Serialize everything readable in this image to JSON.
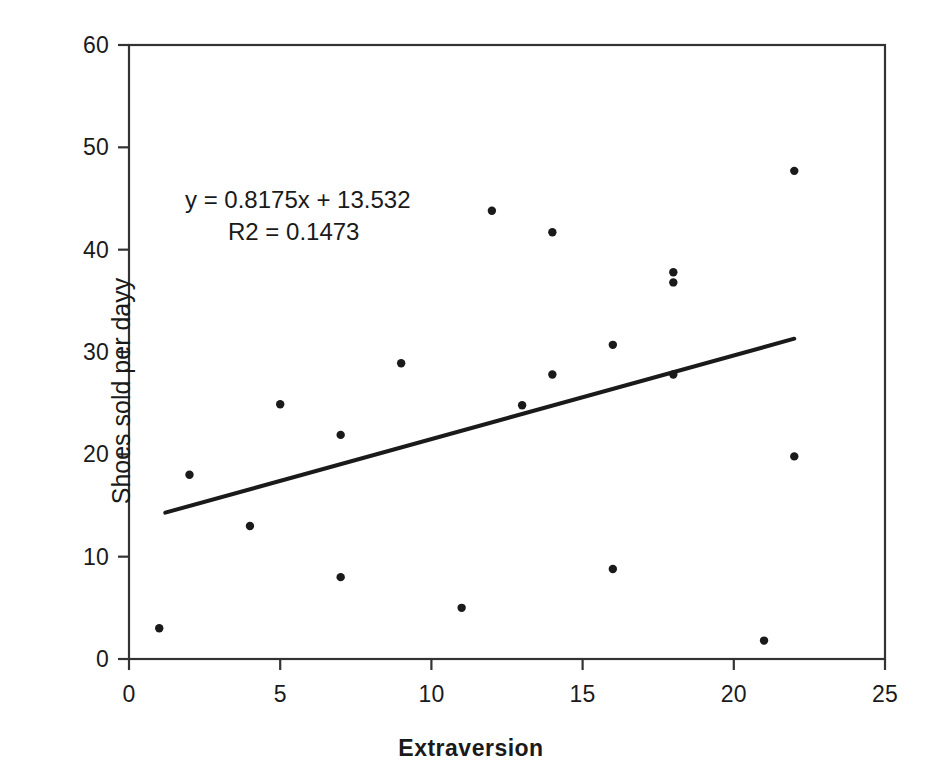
{
  "chart_data": {
    "type": "scatter",
    "title": "",
    "xlabel": "Extraversion",
    "ylabel": "Shoes sold per dayy",
    "xlim": [
      0,
      25
    ],
    "ylim": [
      0,
      60
    ],
    "xticks": [
      0,
      5,
      10,
      15,
      20,
      25
    ],
    "yticks": [
      0,
      10,
      20,
      30,
      40,
      50,
      60
    ],
    "xtick_labels": [
      "0",
      "5",
      "10",
      "15",
      "20",
      "25"
    ],
    "ytick_labels": [
      "0",
      "10",
      "20",
      "30",
      "40",
      "50",
      "60"
    ],
    "grid": false,
    "legend": false,
    "marker_color": "#1a1a1a",
    "line_color": "#1a1a1a",
    "frame_color": "#333333",
    "points": [
      {
        "x": 1,
        "y": 3.0
      },
      {
        "x": 2,
        "y": 18.0
      },
      {
        "x": 4,
        "y": 13.0
      },
      {
        "x": 5,
        "y": 24.9
      },
      {
        "x": 7,
        "y": 8.0
      },
      {
        "x": 7,
        "y": 21.9
      },
      {
        "x": 9,
        "y": 28.9
      },
      {
        "x": 11,
        "y": 5.0
      },
      {
        "x": 12,
        "y": 43.8
      },
      {
        "x": 13,
        "y": 24.8
      },
      {
        "x": 14,
        "y": 41.7
      },
      {
        "x": 14,
        "y": 27.8
      },
      {
        "x": 16,
        "y": 8.8
      },
      {
        "x": 16,
        "y": 30.7
      },
      {
        "x": 18,
        "y": 37.8
      },
      {
        "x": 18,
        "y": 36.8
      },
      {
        "x": 18,
        "y": 27.8
      },
      {
        "x": 21,
        "y": 1.8
      },
      {
        "x": 22,
        "y": 47.7
      },
      {
        "x": 22,
        "y": 19.8
      }
    ],
    "trendline": {
      "slope": 0.8175,
      "intercept": 13.532,
      "x_start": 1.2,
      "x_end": 22.0,
      "y_start": 14.3,
      "y_end": 31.3
    },
    "annotations": {
      "equation": "y = 0.8175x + 13.532",
      "r_squared": "R2 = 0.1473"
    }
  }
}
